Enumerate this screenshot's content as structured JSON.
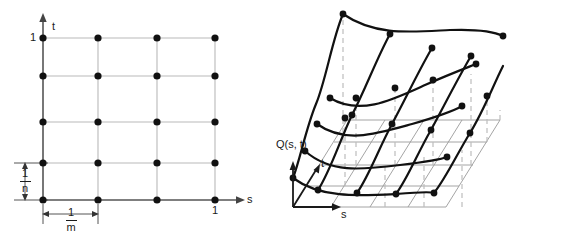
{
  "figure": {
    "background": "#ffffff",
    "ink": "#1a1a1a",
    "grid_line_color": "#b9b9b9",
    "thin_line_color": "#9a9a9a",
    "dashed_line_color": "#bdbdbd",
    "dot_color": "#111111"
  },
  "left_panel": {
    "name": "parameter-domain-grid",
    "axis_x_label": "s",
    "axis_y_label": "t",
    "tick_x_label": "1",
    "tick_y_label": "1",
    "spacing_x": {
      "numerator": "1",
      "denominator": "m"
    },
    "spacing_y": {
      "numerator": "1",
      "denominator": "n"
    },
    "grid_columns": 4,
    "grid_rows": 5,
    "node_count": 20
  },
  "right_panel": {
    "name": "surface-patch-diagram",
    "surface_label": "Q(s, t)",
    "axis_s_label": "s",
    "axis_t_label": "t",
    "curves_s": 4,
    "curves_t": 5
  }
}
